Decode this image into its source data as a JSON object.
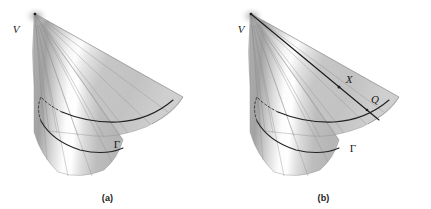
{
  "figure": {
    "kind": "geometry-diagram",
    "background_color": "#ffffff",
    "ink_color": "#1a1a1a",
    "surface_light": "#fbfbfb",
    "surface_mid": "#c9c9c9",
    "surface_dark": "#a6a6a6",
    "surface_edge": "#8e8e8e"
  },
  "panels": [
    {
      "id": "a",
      "caption": "(a)",
      "labels": [
        {
          "name": "vertex",
          "text": "V",
          "style": "italic"
        },
        {
          "name": "directrix",
          "text": "Γ",
          "style": "greek"
        }
      ]
    },
    {
      "id": "b",
      "caption": "(b)",
      "labels": [
        {
          "name": "vertex",
          "text": "V",
          "style": "italic"
        },
        {
          "name": "point-x",
          "text": "X",
          "style": "italic"
        },
        {
          "name": "point-q",
          "text": "Q",
          "style": "italic"
        },
        {
          "name": "directrix",
          "text": "Γ",
          "style": "greek"
        }
      ]
    }
  ]
}
